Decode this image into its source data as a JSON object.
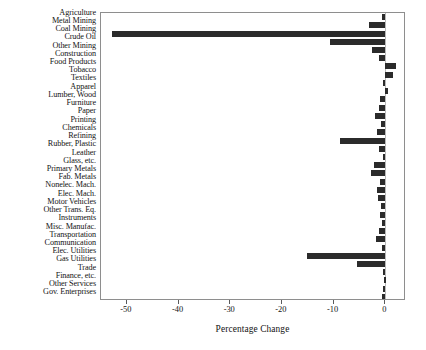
{
  "chart_data": {
    "type": "bar",
    "orientation": "horizontal",
    "title": "",
    "xlabel": "Percentage Change",
    "ylabel": "",
    "xlim": [
      -55,
      4
    ],
    "xticks": [
      -50,
      -40,
      -30,
      -20,
      -10,
      0
    ],
    "xticklabels": [
      "-50",
      "-40",
      "-30",
      "-20",
      "-10",
      "0"
    ],
    "grid": false,
    "legend": null,
    "bar_color": "#2b2b2b",
    "categories": [
      "Agriculture",
      "Metal Mining",
      "Coal Mining",
      "Crude Oil",
      "Other Mining",
      "Construction",
      "Food Products",
      "Tobacco",
      "Textiles",
      "Apparel",
      "Lumber, Wood",
      "Furniture",
      "Paper",
      "Printing",
      "Chemicals",
      "Refining",
      "Rubber, Plastic",
      "Leather",
      "Glass, etc.",
      "Primary Metals",
      "Fab. Metals",
      "Nonelec. Mach.",
      "Elec. Mach.",
      "Motor Vehicles",
      "Other Trans. Eq.",
      "Instruments",
      "Misc. Manufac.",
      "Transportation",
      "Communication",
      "Elec. Utilities",
      "Gas Utilities",
      "Trade",
      "Finance, etc.",
      "Other Services",
      "Gov. Enterprises"
    ],
    "values": [
      -0.6,
      -3.1,
      -52.9,
      -10.7,
      -2.6,
      -1.2,
      2.1,
      1.5,
      -0.5,
      0.2,
      -1.1,
      -1.3,
      -2.0,
      -0.8,
      -1.6,
      -8.7,
      -1.3,
      -0.5,
      -2.1,
      -2.8,
      -1.1,
      -1.7,
      -1.5,
      -0.9,
      -1.0,
      -0.7,
      -1.2,
      -1.9,
      -0.6,
      -15.1,
      -5.4,
      -0.4,
      -0.3,
      -0.5,
      -0.7
    ]
  }
}
